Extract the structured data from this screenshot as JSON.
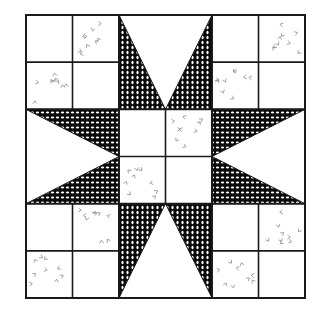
{
  "grid": {
    "columns": 6,
    "rows": 6
  },
  "colors": {
    "background": "#ffffff",
    "line": "#1a1a1a",
    "star_fabric": "#0a0a0a",
    "star_dot": "#ffffff",
    "print_mark": "#8a8a8a"
  },
  "squares": [
    {
      "col": 0,
      "row": 0,
      "fabric": "plain"
    },
    {
      "col": 1,
      "row": 0,
      "fabric": "print"
    },
    {
      "col": 0,
      "row": 1,
      "fabric": "print"
    },
    {
      "col": 1,
      "row": 1,
      "fabric": "plain"
    },
    {
      "col": 4,
      "row": 0,
      "fabric": "plain"
    },
    {
      "col": 5,
      "row": 0,
      "fabric": "print"
    },
    {
      "col": 4,
      "row": 1,
      "fabric": "print"
    },
    {
      "col": 5,
      "row": 1,
      "fabric": "plain"
    },
    {
      "col": 0,
      "row": 4,
      "fabric": "plain"
    },
    {
      "col": 1,
      "row": 4,
      "fabric": "print"
    },
    {
      "col": 0,
      "row": 5,
      "fabric": "print"
    },
    {
      "col": 1,
      "row": 5,
      "fabric": "plain"
    },
    {
      "col": 4,
      "row": 4,
      "fabric": "plain"
    },
    {
      "col": 5,
      "row": 4,
      "fabric": "print"
    },
    {
      "col": 4,
      "row": 5,
      "fabric": "print"
    },
    {
      "col": 5,
      "row": 5,
      "fabric": "plain"
    },
    {
      "col": 2,
      "row": 2,
      "fabric": "plain"
    },
    {
      "col": 3,
      "row": 2,
      "fabric": "print"
    },
    {
      "col": 2,
      "row": 3,
      "fabric": "print"
    },
    {
      "col": 3,
      "row": 3,
      "fabric": "plain"
    }
  ],
  "star_points": [
    {
      "name": "top-left",
      "pts": [
        [
          2,
          0
        ],
        [
          2,
          2
        ],
        [
          3,
          2
        ]
      ]
    },
    {
      "name": "top-right",
      "pts": [
        [
          4,
          0
        ],
        [
          4,
          2
        ],
        [
          3,
          2
        ]
      ]
    },
    {
      "name": "bottom-left",
      "pts": [
        [
          2,
          6
        ],
        [
          2,
          4
        ],
        [
          3,
          4
        ]
      ]
    },
    {
      "name": "bottom-right",
      "pts": [
        [
          4,
          6
        ],
        [
          4,
          4
        ],
        [
          3,
          4
        ]
      ]
    },
    {
      "name": "left-top",
      "pts": [
        [
          0,
          2
        ],
        [
          2,
          2
        ],
        [
          2,
          3
        ]
      ]
    },
    {
      "name": "left-bottom",
      "pts": [
        [
          0,
          4
        ],
        [
          2,
          4
        ],
        [
          2,
          3
        ]
      ]
    },
    {
      "name": "right-top",
      "pts": [
        [
          6,
          2
        ],
        [
          4,
          2
        ],
        [
          4,
          3
        ]
      ]
    },
    {
      "name": "right-bottom",
      "pts": [
        [
          6,
          4
        ],
        [
          4,
          4
        ],
        [
          4,
          3
        ]
      ]
    }
  ]
}
